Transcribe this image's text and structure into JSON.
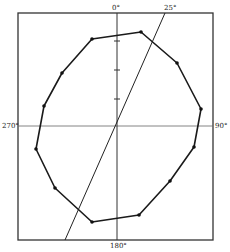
{
  "figure": {
    "type": "polar-diagram",
    "frame": {
      "x1": 18,
      "y1": 13,
      "x2": 213,
      "y2": 240
    },
    "center": {
      "x": 117,
      "y": 126
    },
    "labels": {
      "top": "0°",
      "angle": "25°",
      "right": "90°",
      "bottom": "180°",
      "left": "270°"
    },
    "angle_line": {
      "angle_deg": 25,
      "x1": 165,
      "y1": 13,
      "x2": 65,
      "y2": 240
    },
    "vertical_ticks_y": [
      41,
      70,
      99
    ],
    "polygon_points": [
      [
        92,
        39
      ],
      [
        141,
        32
      ],
      [
        177,
        63
      ],
      [
        201,
        109
      ],
      [
        194,
        147
      ],
      [
        170,
        181
      ],
      [
        139,
        215
      ],
      [
        92,
        222
      ],
      [
        55,
        188
      ],
      [
        36,
        149
      ],
      [
        44,
        106
      ],
      [
        62,
        73
      ]
    ],
    "colors": {
      "line": "#1a1a1a",
      "frame": "#333333",
      "axis": "#555555",
      "background": "#ffffff"
    }
  }
}
